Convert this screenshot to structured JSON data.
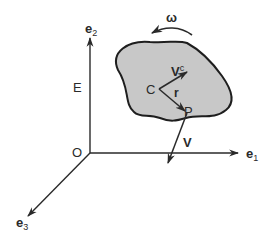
{
  "figure": {
    "labels": {
      "e1": "e",
      "e1_sub": "1",
      "e2": "e",
      "e2_sub": "2",
      "e3": "e",
      "e3_sub": "3",
      "frame": "E",
      "origin": "O",
      "center": "C",
      "point": "P",
      "position_vector": "r",
      "velocity_center": "V",
      "velocity_center_sup": "c",
      "velocity_point": "V",
      "angular_velocity": "ω"
    },
    "colors": {
      "line": "#2a2a2a",
      "body_fill": "#c8c8c8",
      "body_stroke": "#1e1e1e",
      "background": "#ffffff"
    }
  }
}
